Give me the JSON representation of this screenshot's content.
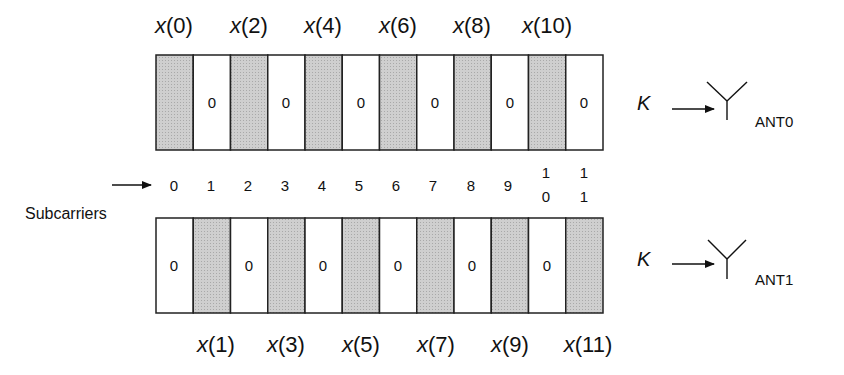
{
  "diagram": {
    "subcarrier_label": "Subcarriers",
    "subcarrier_indices": [
      "0",
      "1",
      "2",
      "3",
      "4",
      "5",
      "6",
      "7",
      "8",
      "9",
      "10",
      "11"
    ],
    "k_label": "K",
    "zero_value": "0",
    "colors": {
      "shaded": "#c8c8c8",
      "border": "#222222",
      "text": "#111111"
    },
    "antenna0": {
      "label": "ANT0",
      "top_labels": [
        "x(0)",
        "x(2)",
        "x(4)",
        "x(6)",
        "x(8)",
        "x(10)"
      ],
      "cells": [
        "x(0)",
        "0",
        "x(2)",
        "0",
        "x(4)",
        "0",
        "x(6)",
        "0",
        "x(8)",
        "0",
        "x(10)",
        "0"
      ]
    },
    "antenna1": {
      "label": "ANT1",
      "bottom_labels": [
        "x(1)",
        "x(3)",
        "x(5)",
        "x(7)",
        "x(9)",
        "x(11)"
      ],
      "cells": [
        "0",
        "x(1)",
        "0",
        "x(3)",
        "0",
        "x(5)",
        "0",
        "x(7)",
        "0",
        "x(9)",
        "0",
        "x(11)"
      ]
    }
  }
}
